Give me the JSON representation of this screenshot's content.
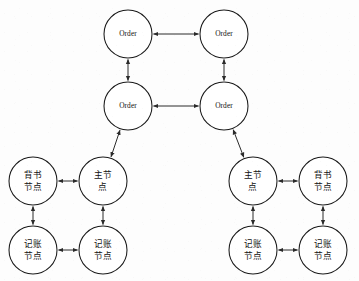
{
  "diagram": {
    "type": "node-link-graph",
    "canvas": {
      "width": 359,
      "height": 281
    },
    "style": {
      "background_color": "#fdfdfd",
      "node_fill": "#ffffff",
      "node_stroke": "#1a1a1a",
      "edge_stroke": "#2a2a2a",
      "label_color": "#111111",
      "node_radius": 24
    },
    "nodes": [
      {
        "id": "order-top-left",
        "label": "Order",
        "lines": [
          "Order"
        ],
        "script": "latin",
        "cx": 128,
        "cy": 34,
        "r": 24
      },
      {
        "id": "order-top-right",
        "label": "Order",
        "lines": [
          "Order"
        ],
        "script": "latin",
        "cx": 224,
        "cy": 34,
        "r": 24
      },
      {
        "id": "order-mid-left",
        "label": "Order",
        "lines": [
          "Order"
        ],
        "script": "latin",
        "cx": 128,
        "cy": 106,
        "r": 24
      },
      {
        "id": "order-mid-right",
        "label": "Order",
        "lines": [
          "Order"
        ],
        "script": "latin",
        "cx": 224,
        "cy": 106,
        "r": 24
      },
      {
        "id": "left-endorse",
        "label": "背书节点",
        "lines": [
          "背书",
          "节点"
        ],
        "script": "cjk",
        "cx": 33,
        "cy": 181,
        "r": 24
      },
      {
        "id": "left-master",
        "label": "主节点",
        "lines": [
          "主节",
          "点"
        ],
        "script": "cjk",
        "cx": 103,
        "cy": 181,
        "r": 24
      },
      {
        "id": "left-ledger-a",
        "label": "记账节点",
        "lines": [
          "记账",
          "节点"
        ],
        "script": "cjk",
        "cx": 33,
        "cy": 250,
        "r": 24
      },
      {
        "id": "left-ledger-b",
        "label": "记账节点",
        "lines": [
          "记账",
          "节点"
        ],
        "script": "cjk",
        "cx": 103,
        "cy": 250,
        "r": 24
      },
      {
        "id": "right-master",
        "label": "主节点",
        "lines": [
          "主节",
          "点"
        ],
        "script": "cjk",
        "cx": 253,
        "cy": 181,
        "r": 24
      },
      {
        "id": "right-endorse",
        "label": "背书节点",
        "lines": [
          "背书",
          "节点"
        ],
        "script": "cjk",
        "cx": 323,
        "cy": 181,
        "r": 24
      },
      {
        "id": "right-ledger-a",
        "label": "记账节点",
        "lines": [
          "记账",
          "节点"
        ],
        "script": "cjk",
        "cx": 253,
        "cy": 250,
        "r": 24
      },
      {
        "id": "right-ledger-b",
        "label": "记账节点",
        "lines": [
          "记账",
          "节点"
        ],
        "script": "cjk",
        "cx": 323,
        "cy": 250,
        "r": 24
      }
    ],
    "edges": [
      {
        "id": "e-order-top",
        "from": "order-top-left",
        "to": "order-top-right",
        "direction": "bidirectional"
      },
      {
        "id": "e-order-mid",
        "from": "order-mid-left",
        "to": "order-mid-right",
        "direction": "bidirectional"
      },
      {
        "id": "e-order-left-col",
        "from": "order-top-left",
        "to": "order-mid-left",
        "direction": "bidirectional"
      },
      {
        "id": "e-order-right-col",
        "from": "order-top-right",
        "to": "order-mid-right",
        "direction": "bidirectional"
      },
      {
        "id": "e-left-uplink",
        "from": "left-master",
        "to": "order-mid-left",
        "direction": "bidirectional"
      },
      {
        "id": "e-right-uplink",
        "from": "right-master",
        "to": "order-mid-right",
        "direction": "bidirectional"
      },
      {
        "id": "e-left-top",
        "from": "left-endorse",
        "to": "left-master",
        "direction": "bidirectional"
      },
      {
        "id": "e-left-bottom",
        "from": "left-ledger-a",
        "to": "left-ledger-b",
        "direction": "bidirectional"
      },
      {
        "id": "e-left-col-a",
        "from": "left-endorse",
        "to": "left-ledger-a",
        "direction": "bidirectional"
      },
      {
        "id": "e-left-col-b",
        "from": "left-master",
        "to": "left-ledger-b",
        "direction": "bidirectional"
      },
      {
        "id": "e-right-top",
        "from": "right-master",
        "to": "right-endorse",
        "direction": "bidirectional"
      },
      {
        "id": "e-right-bottom",
        "from": "right-ledger-a",
        "to": "right-ledger-b",
        "direction": "bidirectional"
      },
      {
        "id": "e-right-col-a",
        "from": "right-master",
        "to": "right-ledger-a",
        "direction": "bidirectional"
      },
      {
        "id": "e-right-col-b",
        "from": "right-endorse",
        "to": "right-ledger-b",
        "direction": "bidirectional"
      }
    ]
  }
}
